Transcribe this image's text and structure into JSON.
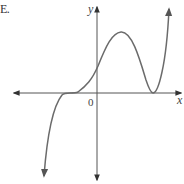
{
  "figure": {
    "option_label": "E.",
    "x_axis_label": "x",
    "y_axis_label": "y",
    "origin_label": "0",
    "curve_color": "#6b6b6b",
    "axis_color": "#555555"
  },
  "curve": {
    "description": "polynomial graph: falls to -infinity on left, flat (triple) root on negative x-axis, positive y-intercept, local max in quadrant I, double root (touch) on positive x-axis, rises to +infinity on right",
    "features": [
      {
        "name": "left-end-behavior",
        "direction": "down"
      },
      {
        "name": "triple-root",
        "x_position": "negative"
      },
      {
        "name": "y-intercept",
        "sign": "positive"
      },
      {
        "name": "local-maximum",
        "quadrant": "I"
      },
      {
        "name": "double-root",
        "x_position": "positive"
      },
      {
        "name": "right-end-behavior",
        "direction": "up"
      }
    ]
  }
}
